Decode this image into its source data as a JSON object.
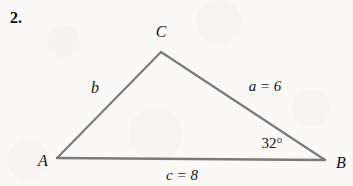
{
  "problem": {
    "number": "2."
  },
  "figure": {
    "type": "triangle-diagram",
    "stroke_color": "#7a7a7a",
    "background_color": "#faf9f7",
    "text_color": "#131313",
    "vertices": {
      "a": {
        "label": "A",
        "x": 57,
        "y": 158
      },
      "b": {
        "label": "B",
        "x": 325,
        "y": 160
      },
      "c": {
        "label": "C",
        "x": 161,
        "y": 52
      }
    },
    "sides": {
      "b": {
        "label": "b",
        "between": "A-C",
        "value": null
      },
      "a": {
        "label": "a = 6",
        "between": "C-B",
        "value": 6
      },
      "c": {
        "label": "c = 8",
        "between": "A-B",
        "value": 8
      }
    },
    "angles": {
      "b": {
        "label": "32°",
        "at_vertex": "B",
        "value": 32
      }
    }
  }
}
